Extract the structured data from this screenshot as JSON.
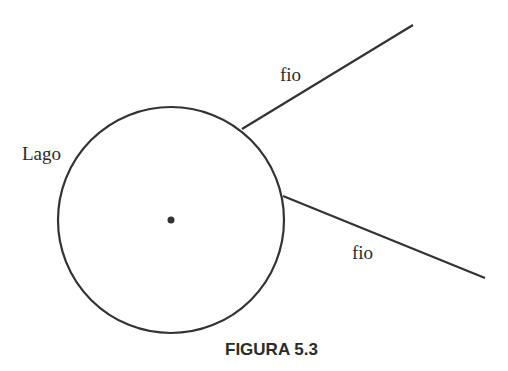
{
  "diagram": {
    "lake_label": "Lago",
    "wire_labels": [
      "fio",
      "fio"
    ],
    "caption": "FIGURA 5.3",
    "colors": {
      "stroke": "#333333",
      "text": "#2b2b2b",
      "background": "#ffffff"
    },
    "circle": {
      "cx": 171,
      "cy": 220,
      "r": 113
    },
    "center_point": {
      "cx": 171,
      "cy": 220
    },
    "wires": [
      {
        "x1": 242,
        "y1": 129,
        "x2": 413,
        "y2": 25
      },
      {
        "x1": 283,
        "y1": 196,
        "x2": 485,
        "y2": 278
      }
    ]
  }
}
